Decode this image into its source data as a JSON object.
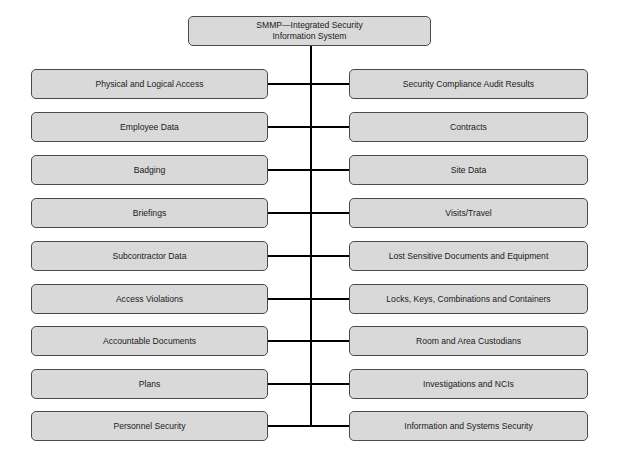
{
  "diagram": {
    "root": {
      "line1": "SMMP—Integrated Security",
      "line2": "Information System"
    },
    "left_nodes": [
      "Physical and Logical Access",
      "Employee Data",
      "Badging",
      "Briefings",
      "Subcontractor Data",
      "Access Violations",
      "Accountable Documents",
      "Plans",
      "Personnel Security"
    ],
    "right_nodes": [
      "Security Compliance Audit Results",
      "Contracts",
      "Site Data",
      "Visits/Travel",
      "Lost Sensitive Documents and Equipment",
      "Locks, Keys, Combinations and Containers",
      "Room and Area Custodians",
      "Investigations and NCIs",
      "Information and Systems Security"
    ],
    "colors": {
      "box_fill": "#d9d9d9",
      "box_border": "#4a4a4a",
      "connector": "#000000"
    }
  }
}
